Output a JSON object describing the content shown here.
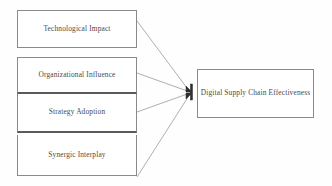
{
  "diagram": {
    "type": "conceptual-framework",
    "background_color": "#fefefe",
    "box_border_color": "#8a8a8a",
    "divider_color": "#5a5a5a",
    "connector_color": "#8d8d8d",
    "arrow_color": "#2e2e2e",
    "text_color": "#4a4a4a",
    "predictors": [
      {
        "id": "technological-impact",
        "label": "Technological Impact"
      },
      {
        "id": "organizational-influence",
        "label": "Organizational Influence"
      },
      {
        "id": "strategy-adoption",
        "label": "Strategy Adoption"
      },
      {
        "id": "synergic-interplay",
        "label": "Synergic Interplay"
      }
    ],
    "outcome": {
      "id": "digital-supply-chain-effectiveness",
      "label": "Digital Supply Chain Effectiveness"
    },
    "connectors": [
      {
        "from": "technological-impact",
        "to": "digital-supply-chain-effectiveness",
        "arrow": true
      },
      {
        "from": "organizational-influence",
        "to": "digital-supply-chain-effectiveness",
        "arrow": true
      },
      {
        "from": "strategy-adoption",
        "to": "digital-supply-chain-effectiveness",
        "arrow": true
      },
      {
        "from": "synergic-interplay",
        "to": "digital-supply-chain-effectiveness",
        "arrow": true
      }
    ]
  }
}
